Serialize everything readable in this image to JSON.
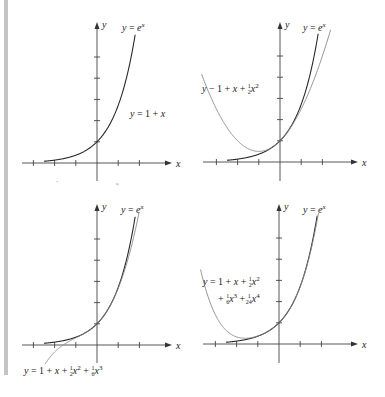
{
  "figure": {
    "axis_labels": {
      "x": "x",
      "y": "y"
    },
    "exp_label": "y = e^x",
    "panels": [
      {
        "id": "linear",
        "approx_label": "y = 1 + x",
        "label_parts": [
          {
            "t": "y",
            "i": true
          },
          {
            "t": " = 1 + "
          },
          {
            "t": "x",
            "i": true
          }
        ],
        "coeffs": [
          1,
          1
        ]
      },
      {
        "id": "quadratic",
        "approx_label": "y = 1 + x + 1/2 x^2",
        "coeffs": [
          1,
          1,
          0.5
        ]
      },
      {
        "id": "cubic",
        "approx_label": "y = 1 + x + 1/2 x^2 + 1/6 x^3",
        "coeffs": [
          1,
          1,
          0.5,
          0.1666667
        ]
      },
      {
        "id": "quartic",
        "approx_label": "y = 1 + x + 1/2 x^2 + 1/6 x^3 + 1/24 x^4",
        "coeffs": [
          1,
          1,
          0.5,
          0.1666667,
          0.0416667
        ]
      }
    ],
    "x_ticks": [
      -3,
      -2,
      -1,
      1,
      2
    ],
    "y_ticks": [
      1,
      2,
      3,
      4,
      5
    ]
  },
  "chart_data": [
    {
      "type": "line",
      "title": "",
      "xlabel": "x",
      "ylabel": "y",
      "series": [
        {
          "name": "y = e^x",
          "function": "exp(x)"
        },
        {
          "name": "y = 1 + x",
          "function": "1 + x"
        }
      ]
    },
    {
      "type": "line",
      "title": "",
      "xlabel": "x",
      "ylabel": "y",
      "series": [
        {
          "name": "y = e^x",
          "function": "exp(x)"
        },
        {
          "name": "y = 1 + x + 1/2 x^2",
          "function": "1 + x + x^2/2"
        }
      ]
    },
    {
      "type": "line",
      "title": "",
      "xlabel": "x",
      "ylabel": "y",
      "series": [
        {
          "name": "y = e^x",
          "function": "exp(x)"
        },
        {
          "name": "y = 1 + x + 1/2 x^2 + 1/6 x^3",
          "function": "1 + x + x^2/2 + x^3/6"
        }
      ]
    },
    {
      "type": "line",
      "title": "",
      "xlabel": "x",
      "ylabel": "y",
      "series": [
        {
          "name": "y = e^x",
          "function": "exp(x)"
        },
        {
          "name": "y = 1 + x + 1/2 x^2 + 1/6 x^3 + 1/24 x^4",
          "function": "1 + x + x^2/2 + x^3/6 + x^4/24"
        }
      ]
    }
  ]
}
